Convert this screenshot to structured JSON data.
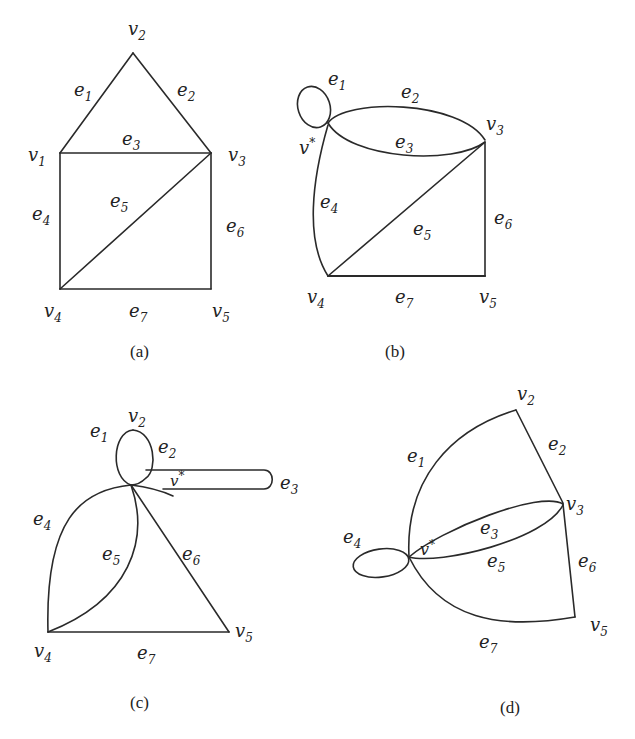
{
  "figure": {
    "panels": [
      {
        "id": "a",
        "caption": "(a)",
        "vertices": [
          "v1",
          "v2",
          "v3",
          "v4",
          "v5"
        ],
        "edges": [
          {
            "name": "e1",
            "ends": [
              "v1",
              "v2"
            ]
          },
          {
            "name": "e2",
            "ends": [
              "v2",
              "v3"
            ]
          },
          {
            "name": "e3",
            "ends": [
              "v1",
              "v3"
            ]
          },
          {
            "name": "e4",
            "ends": [
              "v1",
              "v4"
            ]
          },
          {
            "name": "e5",
            "ends": [
              "v3",
              "v4"
            ]
          },
          {
            "name": "e6",
            "ends": [
              "v3",
              "v5"
            ]
          },
          {
            "name": "e7",
            "ends": [
              "v4",
              "v5"
            ]
          }
        ]
      },
      {
        "id": "b",
        "caption": "(b)",
        "vertices": [
          "v*",
          "v3",
          "v4",
          "v5"
        ],
        "edges": [
          {
            "name": "e1",
            "ends": [
              "v*",
              "v*"
            ]
          },
          {
            "name": "e2",
            "ends": [
              "v*",
              "v3"
            ]
          },
          {
            "name": "e3",
            "ends": [
              "v*",
              "v3"
            ]
          },
          {
            "name": "e4",
            "ends": [
              "v*",
              "v4"
            ]
          },
          {
            "name": "e5",
            "ends": [
              "v3",
              "v4"
            ]
          },
          {
            "name": "e6",
            "ends": [
              "v3",
              "v5"
            ]
          },
          {
            "name": "e7",
            "ends": [
              "v4",
              "v5"
            ]
          }
        ]
      },
      {
        "id": "c",
        "caption": "(c)",
        "vertices": [
          "v2",
          "v*",
          "v4",
          "v5"
        ],
        "edges": [
          {
            "name": "e1",
            "ends": [
              "v*",
              "v2"
            ]
          },
          {
            "name": "e2",
            "ends": [
              "v2",
              "v*"
            ]
          },
          {
            "name": "e3",
            "ends": [
              "v*",
              "v*"
            ]
          },
          {
            "name": "e4",
            "ends": [
              "v*",
              "v4"
            ]
          },
          {
            "name": "e5",
            "ends": [
              "v*",
              "v4"
            ]
          },
          {
            "name": "e6",
            "ends": [
              "v*",
              "v5"
            ]
          },
          {
            "name": "e7",
            "ends": [
              "v4",
              "v5"
            ]
          }
        ]
      },
      {
        "id": "d",
        "caption": "(d)",
        "vertices": [
          "v*",
          "v2",
          "v3",
          "v5"
        ],
        "edges": [
          {
            "name": "e1",
            "ends": [
              "v*",
              "v2"
            ]
          },
          {
            "name": "e2",
            "ends": [
              "v2",
              "v3"
            ]
          },
          {
            "name": "e3",
            "ends": [
              "v*",
              "v3"
            ]
          },
          {
            "name": "e4",
            "ends": [
              "v*",
              "v*"
            ]
          },
          {
            "name": "e5",
            "ends": [
              "v*",
              "v3"
            ]
          },
          {
            "name": "e6",
            "ends": [
              "v3",
              "v5"
            ]
          },
          {
            "name": "e7",
            "ends": [
              "v*",
              "v5"
            ]
          }
        ]
      }
    ],
    "labels": {
      "v": "v",
      "e": "e",
      "star": "*",
      "n1": "1",
      "n2": "2",
      "n3": "3",
      "n4": "4",
      "n5": "5",
      "n6": "6",
      "n7": "7"
    },
    "captions": {
      "a": "(a)",
      "b": "(b)",
      "c": "(c)",
      "d": "(d)"
    }
  }
}
